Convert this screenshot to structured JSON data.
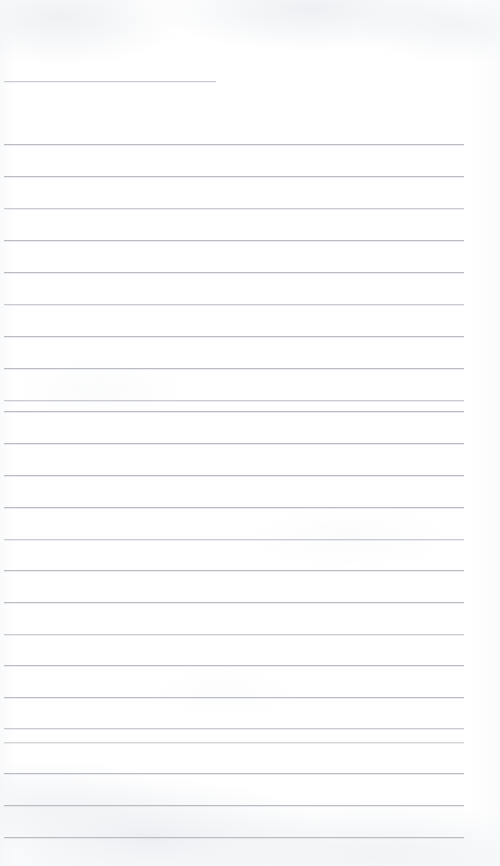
{
  "document": {
    "kind": "scanned-blank-ruled-page",
    "title": "Blank Ruled Notebook Page",
    "page_width": 500,
    "page_height": 866,
    "paper_color": "#ffffff",
    "rule_color": "#b9bcc2",
    "rule_color_faint": "#c9ccd2",
    "rule_color_very_faint": "#d4d7dc",
    "text_content": "",
    "handwriting_present": "none",
    "printed_text_present": "none"
  },
  "ruling": {
    "left_margin_x": 4,
    "right_edge_x": 464,
    "full_rule_width": 460,
    "line_spacing_px": 31.7,
    "first_full_rule_y": 144,
    "last_full_rule_y": 837,
    "full_rule_count": 23,
    "short_rule_count": 1,
    "total_rule_count": 24
  },
  "lines": [
    {
      "id": "rule-01",
      "y": 81,
      "x": 4,
      "width": 212,
      "variant": "faint",
      "kind": "short"
    },
    {
      "id": "rule-02",
      "y": 144,
      "x": 4,
      "width": 460,
      "variant": "normal",
      "kind": "full"
    },
    {
      "id": "rule-03",
      "y": 176,
      "x": 4,
      "width": 460,
      "variant": "normal",
      "kind": "full"
    },
    {
      "id": "rule-04",
      "y": 208,
      "x": 4,
      "width": 460,
      "variant": "faint",
      "kind": "full"
    },
    {
      "id": "rule-05",
      "y": 240,
      "x": 4,
      "width": 460,
      "variant": "normal",
      "kind": "full"
    },
    {
      "id": "rule-06",
      "y": 272,
      "x": 4,
      "width": 460,
      "variant": "normal",
      "kind": "full"
    },
    {
      "id": "rule-07",
      "y": 304,
      "x": 4,
      "width": 460,
      "variant": "faint",
      "kind": "full"
    },
    {
      "id": "rule-08",
      "y": 336,
      "x": 4,
      "width": 460,
      "variant": "normal",
      "kind": "full"
    },
    {
      "id": "rule-09",
      "y": 368,
      "x": 4,
      "width": 460,
      "variant": "normal",
      "kind": "full"
    },
    {
      "id": "rule-10",
      "y": 400,
      "x": 4,
      "width": 460,
      "variant": "faint",
      "kind": "full"
    },
    {
      "id": "rule-11",
      "y": 411,
      "x": 4,
      "width": 460,
      "variant": "normal",
      "kind": "full"
    },
    {
      "id": "rule-12",
      "y": 443,
      "x": 4,
      "width": 460,
      "variant": "normal",
      "kind": "full"
    },
    {
      "id": "rule-13",
      "y": 475,
      "x": 4,
      "width": 460,
      "variant": "normal",
      "kind": "full"
    },
    {
      "id": "rule-14",
      "y": 507,
      "x": 4,
      "width": 460,
      "variant": "normal",
      "kind": "full"
    },
    {
      "id": "rule-15",
      "y": 539,
      "x": 4,
      "width": 460,
      "variant": "faint",
      "kind": "full"
    },
    {
      "id": "rule-16",
      "y": 570,
      "x": 4,
      "width": 460,
      "variant": "normal",
      "kind": "full"
    },
    {
      "id": "rule-17",
      "y": 602,
      "x": 4,
      "width": 460,
      "variant": "normal",
      "kind": "full"
    },
    {
      "id": "rule-18",
      "y": 634,
      "x": 4,
      "width": 460,
      "variant": "faint",
      "kind": "full"
    },
    {
      "id": "rule-19",
      "y": 665,
      "x": 4,
      "width": 460,
      "variant": "normal",
      "kind": "full"
    },
    {
      "id": "rule-20",
      "y": 697,
      "x": 4,
      "width": 460,
      "variant": "normal",
      "kind": "full"
    },
    {
      "id": "rule-21",
      "y": 728,
      "x": 4,
      "width": 460,
      "variant": "faint",
      "kind": "full"
    },
    {
      "id": "rule-22",
      "y": 742,
      "x": 4,
      "width": 460,
      "variant": "vfaint",
      "kind": "full"
    },
    {
      "id": "rule-23",
      "y": 773,
      "x": 4,
      "width": 460,
      "variant": "normal",
      "kind": "full"
    },
    {
      "id": "rule-24",
      "y": 805,
      "x": 4,
      "width": 460,
      "variant": "normal",
      "kind": "full"
    },
    {
      "id": "rule-25",
      "y": 837,
      "x": 4,
      "width": 460,
      "variant": "normal",
      "kind": "full"
    }
  ]
}
